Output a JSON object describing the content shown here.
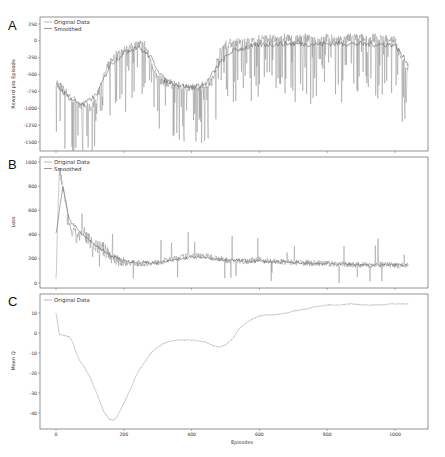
{
  "chart_data": [
    {
      "panel": "A",
      "type": "line",
      "title": "",
      "xlabel": "",
      "ylabel": "Reward pro Episode",
      "xlim": [
        -20,
        1080
      ],
      "ylim": [
        -1600,
        300
      ],
      "yticks": [
        250,
        0,
        -250,
        -500,
        -750,
        -1000,
        -1250,
        -1500
      ],
      "xticks": [
        0,
        200,
        400,
        600,
        800,
        1000
      ],
      "grid": false,
      "legend": {
        "position": "upper left",
        "entries": [
          "Original Data",
          "Smoothed"
        ]
      },
      "series": [
        {
          "name": "Original Data",
          "color": "#8a8a8a",
          "x": [
            0,
            20,
            40,
            60,
            80,
            100,
            120,
            140,
            160,
            180,
            200,
            220,
            240,
            260,
            280,
            300,
            320,
            340,
            360,
            380,
            400,
            420,
            440,
            460,
            480,
            500,
            520,
            540,
            560,
            580,
            600,
            620,
            640,
            660,
            680,
            700,
            720,
            740,
            760,
            780,
            800,
            820,
            840,
            860,
            880,
            900,
            920,
            940,
            960,
            980,
            1000,
            1020,
            1040
          ],
          "values": [
            -600,
            -720,
            -820,
            -900,
            -960,
            -1000,
            -850,
            -550,
            -300,
            -200,
            -150,
            -100,
            -60,
            -40,
            -300,
            -560,
            -600,
            -640,
            -670,
            -700,
            -700,
            -680,
            -640,
            -600,
            -200,
            -50,
            -30,
            -20,
            -40,
            -10,
            20,
            40,
            30,
            10,
            60,
            0,
            30,
            50,
            -20,
            20,
            40,
            10,
            0,
            30,
            60,
            40,
            0,
            50,
            20,
            40,
            10,
            -300,
            -400
          ]
        },
        {
          "name": "Smoothed",
          "color": "#555555",
          "x": [
            0,
            40,
            80,
            120,
            160,
            200,
            240,
            280,
            320,
            360,
            400,
            440,
            480,
            520,
            560,
            600,
            680,
            760,
            840,
            920,
            1000,
            1040
          ],
          "values": [
            -650,
            -850,
            -950,
            -800,
            -350,
            -180,
            -80,
            -250,
            -580,
            -650,
            -690,
            -650,
            -350,
            -150,
            -100,
            -60,
            -40,
            -50,
            -40,
            -50,
            -60,
            -350
          ]
        }
      ]
    },
    {
      "panel": "B",
      "type": "line",
      "title": "",
      "xlabel": "",
      "ylabel": "Loss",
      "xlim": [
        -20,
        1080
      ],
      "ylim": [
        -30,
        1030
      ],
      "yticks": [
        1000,
        800,
        600,
        400,
        200,
        0
      ],
      "xticks": [
        0,
        200,
        400,
        600,
        800,
        1000
      ],
      "grid": false,
      "legend": {
        "position": "upper left",
        "entries": [
          "Original Data",
          "Smoothed"
        ]
      },
      "series": [
        {
          "name": "Original Data",
          "color": "#8a8a8a",
          "x": [
            0,
            10,
            20,
            30,
            40,
            60,
            80,
            100,
            120,
            140,
            160,
            180,
            200,
            250,
            300,
            350,
            400,
            450,
            500,
            550,
            600,
            650,
            700,
            750,
            800,
            850,
            900,
            950,
            1000,
            1040
          ],
          "values": [
            0,
            950,
            800,
            600,
            450,
            380,
            420,
            350,
            300,
            280,
            220,
            200,
            170,
            160,
            170,
            200,
            230,
            220,
            190,
            180,
            190,
            175,
            170,
            165,
            160,
            155,
            150,
            150,
            145,
            150
          ]
        },
        {
          "name": "Smoothed",
          "color": "#555555",
          "x": [
            0,
            20,
            40,
            80,
            120,
            160,
            200,
            300,
            400,
            500,
            600,
            700,
            800,
            900,
            1000,
            1040
          ],
          "values": [
            400,
            800,
            520,
            400,
            310,
            230,
            180,
            165,
            215,
            190,
            180,
            168,
            160,
            152,
            148,
            150
          ]
        }
      ]
    },
    {
      "panel": "C",
      "type": "line",
      "title": "",
      "xlabel": "Episodes",
      "ylabel": "Mean Q",
      "xlim": [
        -20,
        1080
      ],
      "ylim": [
        -46,
        16
      ],
      "yticks": [
        10,
        0,
        -10,
        -20,
        -30,
        -40
      ],
      "xticks": [
        0,
        200,
        400,
        600,
        800,
        1000
      ],
      "grid": false,
      "legend": {
        "position": "upper left",
        "entries": [
          "Original Data"
        ]
      },
      "series": [
        {
          "name": "Original Data",
          "color": "#8a8a8a",
          "x": [
            0,
            5,
            10,
            20,
            30,
            40,
            50,
            60,
            70,
            80,
            100,
            120,
            140,
            160,
            170,
            180,
            200,
            220,
            240,
            260,
            280,
            300,
            320,
            340,
            360,
            380,
            400,
            420,
            440,
            460,
            480,
            500,
            520,
            540,
            560,
            580,
            600,
            620,
            640,
            660,
            680,
            700,
            720,
            740,
            760,
            780,
            800,
            820,
            840,
            860,
            880,
            900,
            920,
            940,
            960,
            980,
            1000,
            1040
          ],
          "values": [
            10,
            5,
            -1,
            -1,
            -1.5,
            -2,
            -5,
            -10,
            -14,
            -16,
            -22,
            -30,
            -39,
            -43.5,
            -43.5,
            -42,
            -35,
            -28,
            -20,
            -15,
            -10,
            -7,
            -5,
            -4,
            -3.5,
            -3.5,
            -3.5,
            -4,
            -4.5,
            -6,
            -7,
            -6,
            -3,
            2,
            5,
            7,
            8.5,
            9,
            9,
            9.5,
            10,
            11,
            11.5,
            12,
            13,
            13.5,
            14,
            14,
            14,
            14.5,
            14.5,
            14,
            14,
            14,
            14,
            14.5,
            14.5,
            14.5
          ]
        }
      ]
    }
  ],
  "panels": {
    "A": {
      "letter": "A",
      "ylabel": "Reward pro Episode",
      "yticks": [
        "250",
        "0",
        "-250",
        "-500",
        "-750",
        "-1000",
        "-1250",
        "-1500"
      ],
      "legend": [
        "Original Data",
        "Smoothed"
      ]
    },
    "B": {
      "letter": "B",
      "ylabel": "Loss",
      "yticks": [
        "1000",
        "800",
        "600",
        "400",
        "200",
        "0"
      ],
      "legend": [
        "Original Data",
        "Smoothed"
      ]
    },
    "C": {
      "letter": "C",
      "ylabel": "Mean Q",
      "yticks": [
        "10",
        "0",
        "-10",
        "-20",
        "-30",
        "-40"
      ],
      "legend": [
        "Original Data"
      ]
    }
  },
  "xaxis": {
    "label": "Episodes",
    "ticks": [
      "0",
      "200",
      "400",
      "600",
      "800",
      "1000"
    ]
  },
  "colors": {
    "original": "#8a8a8a",
    "smoothed": "#555555",
    "frame": "#666666"
  }
}
